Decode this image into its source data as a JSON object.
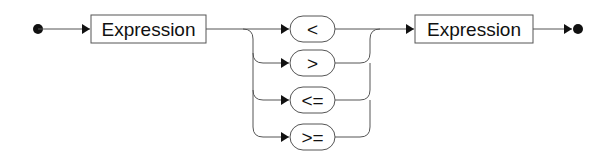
{
  "diagram": {
    "type": "railroad-syntax-diagram",
    "start": "start-dot",
    "end": "end-dot",
    "left_expression": {
      "label": "Expression"
    },
    "operators": [
      {
        "label": "<"
      },
      {
        "label": ">"
      },
      {
        "label": "<="
      },
      {
        "label": ">="
      }
    ],
    "right_expression": {
      "label": "Expression"
    },
    "colors": {
      "line": "#555555",
      "text": "#111111",
      "background": "#ffffff"
    }
  }
}
